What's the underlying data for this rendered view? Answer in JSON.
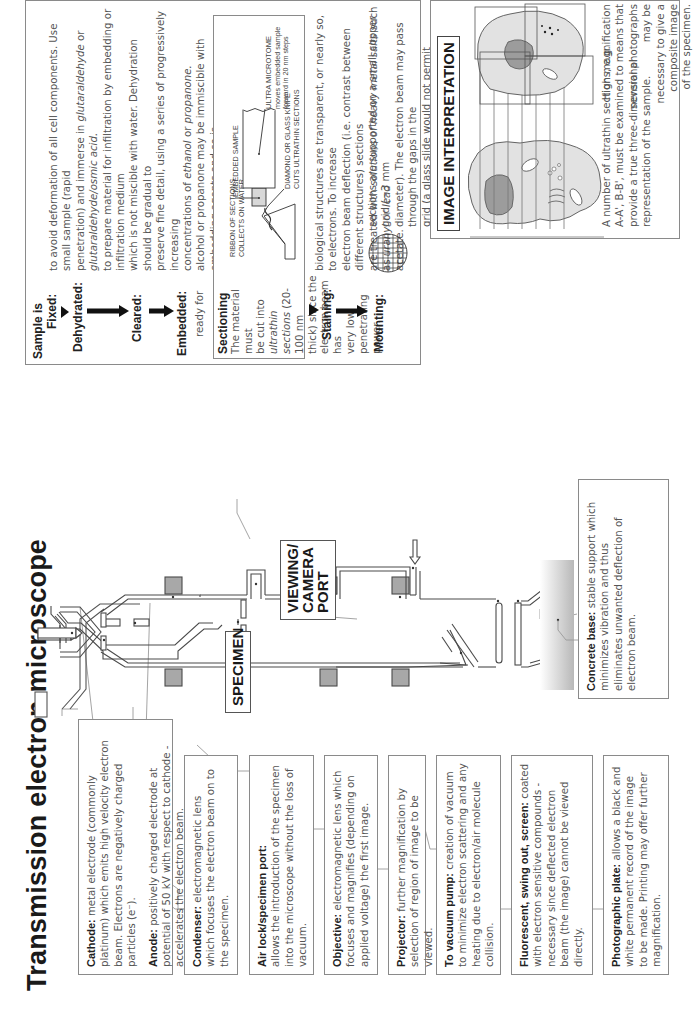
{
  "title": "Transmission electron microscope",
  "callouts": {
    "specimen": "SPECIMEN",
    "viewing_line1": "VIEWING/",
    "viewing_line2": "CAMERA",
    "viewing_line3": "PORT"
  },
  "parts": {
    "cathode": {
      "label": "Cathode:",
      "text": "metal electrode (commonly platinum) which emits high velocity electron beam. Electrons are negatively charged particles (e⁻)."
    },
    "anode": {
      "label": "Anode:",
      "text": "positively charged electrode at potential of 50 kV with respect to cathode - accelerates the electron beam."
    },
    "condenser": {
      "label": "Condenser:",
      "text": "electromagnetic lens which focuses the electron beam on to the specimen."
    },
    "airlock": {
      "label": "Air lock/specimen port:",
      "text": "allows the introduction of the specimen into the microscope without the loss of vacuum."
    },
    "objective": {
      "label": "Objective:",
      "text": "electromagnetic lens which focuses and magnifies (depending on applied voltage) the first image."
    },
    "projector": {
      "label": "Projector:",
      "text": "further magnification by selection of region of image to be viewed."
    },
    "vacuum": {
      "label": "To vacuum pump:",
      "text": "creation of vacuum to minimize electron scattering and any heating due to electron/air molecule collision."
    },
    "fluorescent": {
      "label": "Fluorescent, swing out, screen:",
      "text": "coated with electron sensitive compounds - necessary since deflected electron beam (the image) cannot be viewed directly."
    },
    "photographic": {
      "label": "Photographic plate:",
      "text": "allows a black and white permanent record of the image to be made. Printing may offer further magnification."
    },
    "concrete": {
      "label": "Concrete base:",
      "text": "stable support which minimizes vibration and thus eliminates unwanted deflection of electron beam."
    }
  },
  "preparation": {
    "sample_is": "Sample is",
    "steps": {
      "fixed": "Fixed:",
      "dehydrated": "Dehydrated:",
      "cleared": "Cleared:",
      "embedded": "Embedded:",
      "embedded_sub": "ready for",
      "staining": "Staining:",
      "mounting": "Mounting:"
    },
    "text": {
      "fixed_a": "to avoid deformation of all cell components. Use small sample (rapid",
      "fixed_b1": "penetration) and immerse in ",
      "fixed_b2": "glutaraldehyde",
      "fixed_b3": " or ",
      "fixed_b4": "glutaraldehyde/osmic acid.",
      "dehyd_a": "to prepare material for infiltration by embedding or infiltration medium",
      "dehyd_b": "which is not miscible with water. Dehydration should be gradual to",
      "dehyd_c": "preserve fine detail, using a series of progressively increasing",
      "dehyd_d1": "concentrations of ",
      "dehyd_d2": "ethanol",
      "dehyd_d3": " or ",
      "dehyd_d4": "propanone.",
      "clear_a": "alcohol or propanone may be immiscible with embedding agents and so is",
      "clear_b1": "replaced with a clearing agent (commonly ",
      "clear_b2": "xylol",
      "clear_b3": ") which is miscible and",
      "clear_c": "also makes the material transparent.",
      "embed_a1": "plastic",
      "embed_a2": " or ",
      "embed_a3": "resin",
      "embed_a4": " is used to support the material so that it is not distorted",
      "embed_b": "during sectioning.",
      "stain_a": "biological structures are transparent, or nearly so, to electrons. To increase",
      "stain_b": "electron beam deflection (i.e. contrast between different structures) sections",
      "stain_c1": "are treated with ",
      "stain_c2": "solutions of heavy metal salts",
      "stain_c3": " such as ",
      "stain_c4": "uranyl",
      "stain_c5": " or ",
      "stain_c6": "lead",
      "stain_d": "acetate.",
      "mount_a": "sections are supported on a small copper grid (~3 mm",
      "mount_b": "diameter). The electron beam may pass through the gaps in the",
      "mount_c": "grid (a glass slide would not permit transmission of electron",
      "mount_d": "beam)."
    },
    "sectioning": {
      "heading": "Sectioning",
      "l1": "The material must",
      "l2a": "be cut into ",
      "l2b": "ultrathin",
      "l3a": "sections",
      "l3b": " (20-100 nm",
      "l4": "thick) since the",
      "l5": "electron beam has",
      "l6": "very low penetrating",
      "l7": "power.",
      "diagram": {
        "ribbon_1": "RIBBON OF SECTIONS",
        "ribbon_2": "COLLECTS ON WATER",
        "embedded": "EMBEDDED SAMPLE",
        "knife_1": "DIAMOND OR GLASS KNIFE",
        "knife_2": "CUTS ULTRATHIN SECTIONS",
        "microtome_1": "ULTRA MICROTOME",
        "microtome_2": "moves embedded sample",
        "microtome_3": "forward in 20 nm steps"
      }
    }
  },
  "image_interpretation": {
    "heading": "IMAGE INTERPRETATION",
    "section_labels_left": [
      "A",
      "B",
      "C",
      "D"
    ],
    "section_labels_right": [
      "A'",
      "B'",
      "C'",
      "D'"
    ],
    "text_1": "A number of ultrathin sections, e.g.",
    "text_2": "A-A', B-B', must be examined to",
    "text_3": "provide a true three-dimensional",
    "text_4": "representation of the sample.",
    "text_5": "High magnification means that",
    "text_6": "several photographs may be",
    "text_7": "necessary to give a composite image",
    "text_8": "of the specimen."
  },
  "colors": {
    "lens": "#a8a8a8",
    "cell": "#e2e2e2",
    "nucleus": "#9c9c9c",
    "border": "#8a8a8a"
  }
}
